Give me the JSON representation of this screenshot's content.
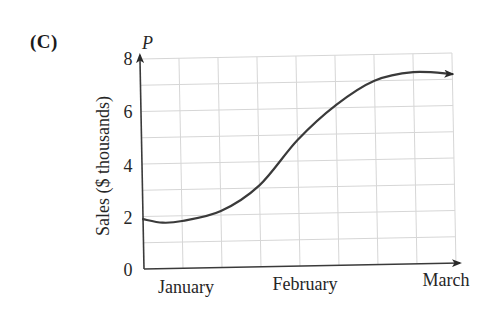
{
  "panel_label": "(C)",
  "chart_data": {
    "type": "line",
    "title": "",
    "panel": "(C)",
    "xlabel": "",
    "ylabel": "Sales ($ thousands)",
    "y_variable": "P",
    "x_tick_labels": [
      "January",
      "February",
      "March"
    ],
    "x_tick_positions_months": [
      0,
      1,
      2
    ],
    "y_ticks": [
      0,
      2,
      4,
      6,
      8
    ],
    "ylim": [
      0,
      8
    ],
    "xlim_months": [
      0,
      2
    ],
    "grid": true,
    "grid_minor_x_step_months": 0.25,
    "grid_minor_y_step": 1,
    "axis_arrows": true,
    "curve_end_arrow": true,
    "series": [
      {
        "name": "Sales",
        "x_months": [
          0,
          0.125,
          0.25,
          0.5,
          0.75,
          1.0,
          1.25,
          1.5,
          1.75,
          2.0
        ],
        "values": [
          1.9,
          1.75,
          1.8,
          2.15,
          3.1,
          4.8,
          6.1,
          7.0,
          7.3,
          7.2
        ]
      }
    ]
  },
  "colors": {
    "grid": "#d6d6d6",
    "axis": "#3a3a3a",
    "curve": "#3a3a3a",
    "text": "#262626"
  }
}
